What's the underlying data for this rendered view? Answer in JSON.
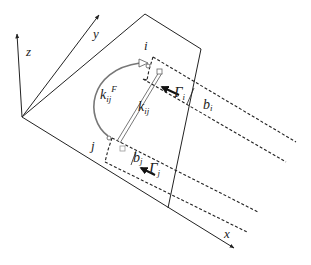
{
  "diagram": {
    "axes": {
      "x_label": "x",
      "y_label": "y",
      "z_label": "z"
    },
    "panels": {
      "i": {
        "label": "i",
        "circulation": "Γ",
        "circulation_sub": "i",
        "width": "b",
        "width_sub": "i"
      },
      "j": {
        "label": "j",
        "circulation": "Γ",
        "circulation_sub": "j",
        "width": "b",
        "width_sub": "j"
      }
    },
    "couplings": {
      "elastic": {
        "symbol": "k",
        "sub": "ij"
      },
      "flow": {
        "symbol": "k",
        "sub": "ij",
        "sup": "F"
      }
    },
    "colors": {
      "line": "#222222",
      "arc": "#777777"
    }
  }
}
